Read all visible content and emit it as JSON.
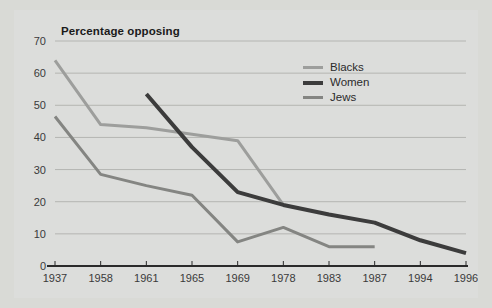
{
  "chart_data": {
    "type": "line",
    "title": "Percentage opposing",
    "xlabel": "",
    "ylabel": "",
    "ylim": [
      0,
      70
    ],
    "yticks": [
      0,
      10,
      20,
      30,
      40,
      50,
      60,
      70
    ],
    "grid": true,
    "legend_position": "top-center-right",
    "categories": [
      "1937",
      "1958",
      "1961",
      "1965",
      "1969",
      "1978",
      "1983",
      "1987",
      "1994",
      "1996"
    ],
    "series": [
      {
        "name": "Blacks",
        "color": "#9d9e9c",
        "values": [
          64,
          44,
          43,
          41,
          39,
          19,
          null,
          null,
          null,
          null
        ]
      },
      {
        "name": "Women",
        "color": "#3c3c3c",
        "values": [
          null,
          null,
          53.5,
          37,
          23,
          19,
          16,
          13.5,
          8,
          4
        ]
      },
      {
        "name": "Jews",
        "color": "#848582",
        "values": [
          46.5,
          28.5,
          25,
          22,
          7.5,
          12,
          6,
          6,
          null,
          null
        ]
      }
    ]
  },
  "legend": {
    "items": [
      {
        "label": "Blacks",
        "color": "#9d9e9c"
      },
      {
        "label": "Women",
        "color": "#3c3c3c"
      },
      {
        "label": "Jews",
        "color": "#848582"
      }
    ]
  },
  "colors": {
    "background": "#d9dad6",
    "plot_background": "#dcdddb",
    "gridline": "#b4b5b2",
    "axis": "#2a2a2a",
    "title": "#1a1a1a",
    "tick_text": "#3a3a3a"
  }
}
